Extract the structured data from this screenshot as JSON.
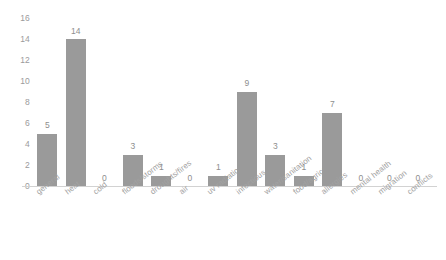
{
  "chart_data": {
    "type": "bar",
    "title": "",
    "subtitle": "",
    "xlabel": "",
    "ylabel": "",
    "categories": [
      "general",
      "heat",
      "cold",
      "floods/storms",
      "droughts/fires",
      "air",
      "uv radiation",
      "infectious",
      "water/sanitation",
      "food/agriculture",
      "allergies",
      "mental health",
      "migration",
      "conflicts"
    ],
    "values": [
      5,
      14,
      0,
      3,
      1,
      0,
      1,
      9,
      3,
      1,
      7,
      0,
      0,
      0
    ],
    "value_labels": [
      "5",
      "14",
      "0",
      "3",
      "1",
      "0",
      "1",
      "9",
      "3",
      "1",
      "7",
      "0",
      "0",
      "0"
    ],
    "ylim": [
      0,
      16
    ],
    "ytick_labels": [
      "0",
      "2",
      "4",
      "6",
      "8",
      "10",
      "12",
      "14",
      "16"
    ],
    "ytick_values": [
      0,
      2,
      4,
      6,
      8,
      10,
      12,
      14,
      16
    ],
    "grid": false,
    "legend": null,
    "legend_position": "none",
    "bar_color": "#9a9a9a",
    "axis_color": "#d2d2d2",
    "tick_text_color": "#9b9b9b",
    "label_text_color": "#a2a2a2",
    "value_text_color": "#8e8e8e",
    "background_color": "#ffffff"
  }
}
